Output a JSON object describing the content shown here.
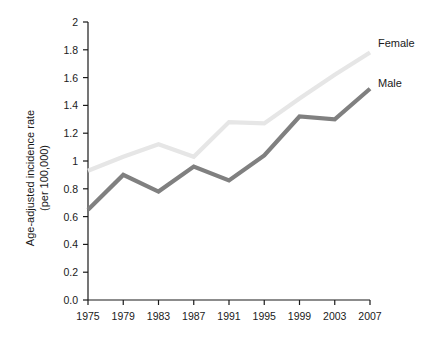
{
  "chart_data": {
    "type": "line",
    "title": "",
    "subtitle": "",
    "xlabel": "",
    "ylabel_line1": "Age-adjusted incidence rate",
    "ylabel_line2": "(per 100,000)",
    "categories": [
      "1975",
      "1979",
      "1983",
      "1987",
      "1991",
      "1995",
      "1999",
      "2003",
      "2007"
    ],
    "x": [
      1975,
      1979,
      1983,
      1987,
      1991,
      1995,
      1999,
      2003,
      2007
    ],
    "xlim": [
      1975,
      2007
    ],
    "ylim": [
      0.0,
      2.0
    ],
    "yticks": [
      0.0,
      0.2,
      0.4,
      0.6,
      0.8,
      1.0,
      1.2,
      1.4,
      1.6,
      1.8,
      2.0
    ],
    "ytick_labels": [
      "0.0",
      "0.2",
      "0.4",
      "0.6",
      "0.8",
      "1",
      "1.2",
      "1.4",
      "1.6",
      "1.8",
      "2"
    ],
    "grid": false,
    "legend_position": "right-inline",
    "series": [
      {
        "name": "Female",
        "color": "#e6e6e6",
        "values": [
          0.93,
          1.03,
          1.12,
          1.03,
          1.28,
          1.27,
          1.45,
          1.62,
          1.78
        ]
      },
      {
        "name": "Male",
        "color": "#808080",
        "values": [
          0.65,
          0.9,
          0.78,
          0.96,
          0.86,
          1.04,
          1.32,
          1.3,
          1.52
        ]
      }
    ],
    "annotations": [
      {
        "text": "Female",
        "series": "Female"
      },
      {
        "text": "Male",
        "series": "Male"
      }
    ]
  },
  "colors": {
    "axis": "#1a1a1a",
    "background": "#ffffff",
    "female_series": "#e6e6e6",
    "male_series": "#808080"
  }
}
